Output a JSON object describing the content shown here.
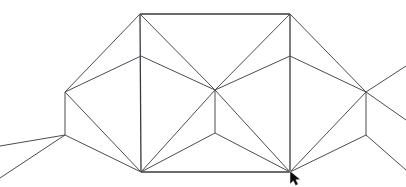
{
  "scene": {
    "title": "Wireframe Mesh",
    "canvas": {
      "width": 406,
      "height": 187,
      "background": "#ffffff"
    },
    "stroke_color": "#4c4c52",
    "stroke_color_heavy": "#3a3a40",
    "stroke_width": 1
  },
  "vertices": {
    "top_left": {
      "name": "top-left-apex",
      "x": 140,
      "y": 14
    },
    "top_right": {
      "name": "top-right-apex",
      "x": 290,
      "y": 14
    },
    "bottom_left": {
      "name": "bottom-left-corner",
      "x": 141,
      "y": 172
    },
    "bottom_right": {
      "name": "bottom-right-corner",
      "x": 290,
      "y": 172
    },
    "mid_left": {
      "name": "left-vertical-mid-node",
      "x": 141,
      "y": 56
    },
    "mid_right": {
      "name": "right-vertical-mid-node",
      "x": 290,
      "y": 56
    },
    "center_hub": {
      "name": "center-hub",
      "x": 215,
      "y": 90
    },
    "center_branch": {
      "name": "center-branch-node",
      "x": 215,
      "y": 133
    },
    "left_peak": {
      "name": "left-wing-peak",
      "x": 65,
      "y": 92
    },
    "left_branch": {
      "name": "left-wing-branch",
      "x": 65,
      "y": 135
    },
    "right_peak": {
      "name": "right-wing-peak",
      "x": 366,
      "y": 92
    },
    "right_branch": {
      "name": "right-wing-branch",
      "x": 366,
      "y": 135
    }
  },
  "edges": {
    "frame_top": "M140,14 L290,14",
    "frame_bottom": "M141,172 L290,172",
    "frame_left_vertical": "M140,14 L141,172",
    "frame_right_vertical": "M290,14 L290,172",
    "tl_to_center": "M140,14 L215,90",
    "tr_to_center": "M290,14 L215,90",
    "midleft_to_center": "M141,56 L215,90",
    "midright_to_center": "M290,56 L215,90",
    "tl_to_leftpeak": "M140,14 L65,92",
    "midleft_to_leftpeak": "M141,56 L65,92",
    "tr_to_rightpeak": "M290,14 L366,92",
    "midright_to_rightpeak": "M290,56 L366,92",
    "center_vertical": "M215,90 L215,133",
    "center_branch_left": "M215,133 L141,172",
    "center_branch_right": "M215,133 L290,172",
    "center_to_bl": "M215,90 L141,172",
    "center_to_br": "M215,90 L290,172",
    "left_vertical": "M65,92 L65,135",
    "left_branch_up_offscreen": "M65,135 L0,178",
    "left_branch_mid_offscreen": "M65,135 L0,146",
    "leftpeak_to_bl": "M65,92 L141,172",
    "leftbranch_to_bl": "M65,135 L141,172",
    "right_vertical": "M366,92 L366,135",
    "right_peak_offscreen_up": "M366,92 L406,66",
    "right_peak_offscreen_down": "M366,92 L406,120",
    "rightpeak_to_br": "M366,92 L290,172",
    "rightbranch_to_br": "M366,135 L290,172",
    "right_branch_offscreen": "M366,135 L406,170"
  },
  "cursor": {
    "name": "mouse-pointer",
    "x": 290,
    "y": 171,
    "shape": "arrow",
    "color": "#0a0a0a"
  }
}
